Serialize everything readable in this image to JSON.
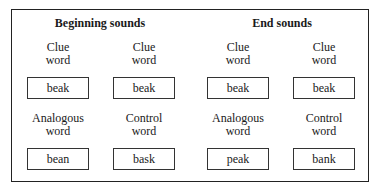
{
  "headings": {
    "beginning": "Beginning sounds",
    "end": "End sounds"
  },
  "columns": [
    {
      "top_label": [
        "Clue",
        "word"
      ],
      "top_word": "beak",
      "bottom_label": [
        "Analogous",
        "word"
      ],
      "bottom_word": "bean"
    },
    {
      "top_label": [
        "Clue",
        "word"
      ],
      "top_word": "beak",
      "bottom_label": [
        "Control",
        "word"
      ],
      "bottom_word": "bask"
    },
    {
      "top_label": [
        "Clue",
        "word"
      ],
      "top_word": "beak",
      "bottom_label": [
        "Analogous",
        "word"
      ],
      "bottom_word": "peak"
    },
    {
      "top_label": [
        "Clue",
        "word"
      ],
      "top_word": "beak",
      "bottom_label": [
        "Control",
        "word"
      ],
      "bottom_word": "bank"
    }
  ]
}
